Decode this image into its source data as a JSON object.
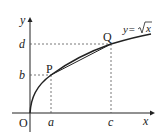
{
  "diagram": {
    "axes": {
      "x_label": "x",
      "y_label": "y",
      "origin_label": "O"
    },
    "curve": {
      "equation_prefix": "y=",
      "equation_radicand": "x"
    },
    "points": [
      {
        "name": "P",
        "x_label": "a",
        "y_label": "b"
      },
      {
        "name": "Q",
        "x_label": "c",
        "y_label": "d"
      }
    ],
    "colors": {
      "stroke": "#222222",
      "guide": "#555555"
    }
  }
}
